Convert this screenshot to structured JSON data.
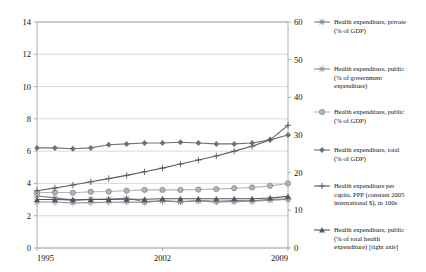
{
  "chart_data": {
    "type": "line",
    "title": "",
    "xlabel": "",
    "ylabel": "",
    "grid": true,
    "legend_position": "right",
    "x": [
      1995,
      1996,
      1997,
      1998,
      1999,
      2000,
      2001,
      2002,
      2003,
      2004,
      2005,
      2006,
      2007,
      2008,
      2009
    ],
    "xtick_labels": [
      "1995",
      "2002",
      "2009"
    ],
    "xticks": [
      1995,
      2002,
      2009
    ],
    "xlim": [
      1995,
      2009
    ],
    "ylim": [
      0,
      14
    ],
    "yticks": [
      0,
      2,
      4,
      6,
      8,
      10,
      12,
      14
    ],
    "ytick_labels": [
      "0",
      "2",
      "4",
      "6",
      "8",
      "10",
      "12",
      "14"
    ],
    "ylim_right": [
      0,
      60
    ],
    "yticks_right": [
      0,
      10,
      20,
      30,
      40,
      50,
      60
    ],
    "ytick_labels_right": [
      "0",
      "10",
      "20",
      "30",
      "40",
      "50",
      "60"
    ],
    "series": [
      {
        "name": "Health expenditure, private (% of GDP)",
        "axis": "right",
        "marker": "star",
        "color": "#7d7d8a",
        "values": [
          13.8,
          13.3,
          12.7,
          12.9,
          13.0,
          13.2,
          12.3,
          12.5,
          12.2,
          12.6,
          12.4,
          12.6,
          12.5,
          12.9,
          13.0
        ]
      },
      {
        "name": "Health expenditure, public (% of government expenditure)",
        "axis": "right",
        "marker": "star",
        "color": "#8d8d96",
        "values": [
          12.2,
          12.2,
          11.95,
          12.05,
          12.15,
          12.2,
          12.1,
          12.55,
          12.3,
          12.5,
          12.25,
          12.3,
          12.4,
          12.7,
          12.9
        ]
      },
      {
        "name": "Health expenditure, public (% of GDP)",
        "axis": "left",
        "marker": "circle",
        "color": "#b3b3b3",
        "values": [
          3.42,
          3.45,
          3.42,
          3.48,
          3.5,
          3.55,
          3.6,
          3.6,
          3.6,
          3.62,
          3.65,
          3.7,
          3.75,
          3.85,
          4.0
        ]
      },
      {
        "name": "Health expenditure, total (% of GDP)",
        "axis": "left",
        "marker": "diamond",
        "color": "#6f6f7a",
        "values": [
          6.2,
          6.2,
          6.15,
          6.2,
          6.4,
          6.45,
          6.5,
          6.5,
          6.55,
          6.5,
          6.45,
          6.45,
          6.5,
          6.7,
          7.0
        ]
      },
      {
        "name": "Health expenditure per capita, PPP (constant 2005 international $), in 100s",
        "axis": "left",
        "marker": "plus",
        "color": "#5a5a64",
        "values": [
          3.55,
          3.72,
          3.9,
          4.1,
          4.3,
          4.5,
          4.72,
          4.95,
          5.2,
          5.45,
          5.7,
          6.0,
          6.3,
          6.7,
          7.6
        ]
      },
      {
        "name": "Health expenditure, public (% of total health expenditure) [right axis]",
        "axis": "left",
        "marker": "triangle",
        "color": "#55555f",
        "values": [
          3.0,
          3.0,
          2.98,
          3.0,
          3.0,
          3.02,
          3.02,
          3.05,
          3.05,
          3.05,
          3.05,
          3.05,
          3.05,
          3.1,
          3.2
        ]
      }
    ],
    "legend_entries": [
      {
        "label_lines": [
          "Health expenditure, private",
          "(% of GDP)"
        ],
        "marker": "star",
        "color": "#7d7d8a"
      },
      {
        "label_lines": [
          "Health expenditure, public",
          "(% of government",
          "expenditure)"
        ],
        "marker": "star",
        "color": "#8d8d96"
      },
      {
        "label_lines": [
          "Health expenditure, public",
          "(% of GDP)"
        ],
        "marker": "circle",
        "color": "#b3b3b3"
      },
      {
        "label_lines": [
          "Health expenditure, total",
          "(% of GDP)"
        ],
        "marker": "diamond",
        "color": "#6f6f7a"
      },
      {
        "label_lines": [
          "Health expenditure per",
          "capita, PPP (constant 2005",
          "international $), in 100s"
        ],
        "marker": "plus",
        "color": "#5a5a64"
      },
      {
        "label_lines": [
          "Health expenditure, public",
          "(% of total health",
          "expenditure) [right axis]"
        ],
        "marker": "triangle",
        "color": "#55555f"
      }
    ]
  }
}
